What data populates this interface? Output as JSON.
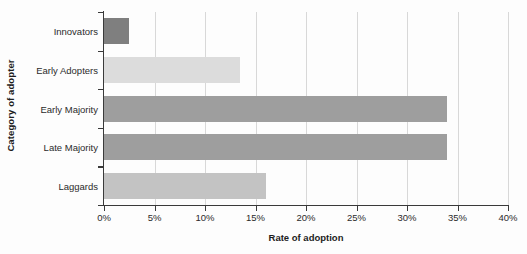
{
  "chart_data": {
    "type": "bar",
    "orientation": "horizontal",
    "title": "",
    "xlabel": "Rate of adoption",
    "ylabel": "Category of adopter",
    "categories": [
      "Innovators",
      "Early Adopters",
      "Early Majority",
      "Late Majority",
      "Laggards"
    ],
    "values": [
      2.5,
      13.5,
      34,
      34,
      16
    ],
    "value_labels": [
      "2.5%",
      "13.5%",
      "34%",
      "34%",
      "16%"
    ],
    "bar_colors": [
      "#7f7f7f",
      "#dcdcdc",
      "#9e9e9e",
      "#9e9e9e",
      "#c3c3c3"
    ],
    "xlim": [
      0,
      40
    ],
    "xticks": [
      0,
      5,
      10,
      15,
      20,
      25,
      30,
      35,
      40
    ],
    "xtick_labels": [
      "0%",
      "5%",
      "10%",
      "15%",
      "20%",
      "25%",
      "30%",
      "35%",
      "40%"
    ],
    "grid": true,
    "grid_axis": "x",
    "grid_color": "#d8d8d8",
    "legend": false,
    "axis_color": "#3a3a3a",
    "background": "#fdfdfd"
  }
}
